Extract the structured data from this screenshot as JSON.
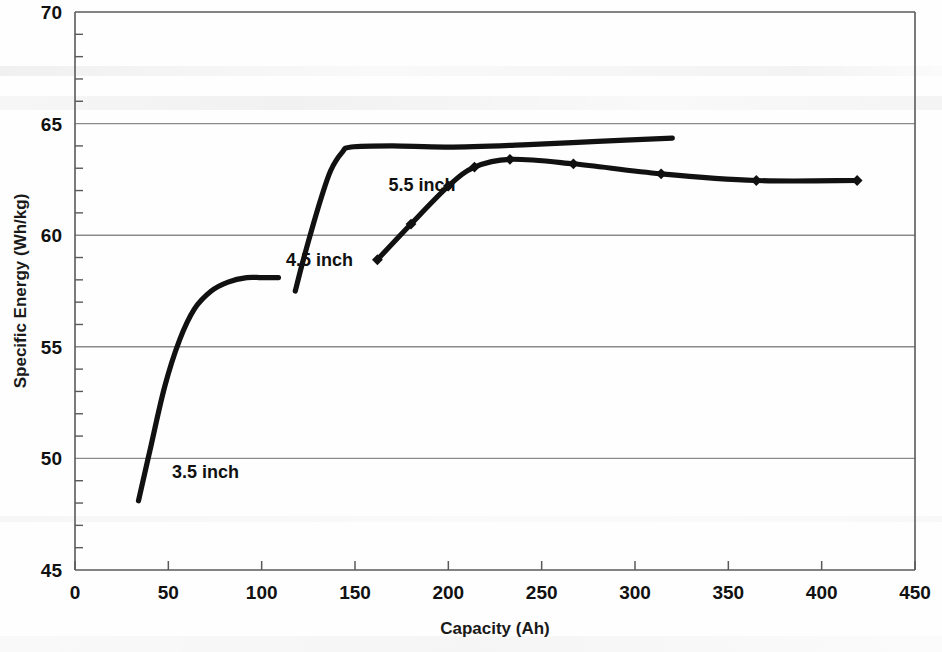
{
  "chart_data": {
    "type": "line",
    "title": "",
    "xlabel": "Capacity (Ah)",
    "ylabel": "Specific Energy (Wh/kg)",
    "xlim": [
      0,
      450
    ],
    "ylim": [
      45,
      70
    ],
    "xticks": [
      0,
      50,
      100,
      150,
      200,
      250,
      300,
      350,
      400,
      450
    ],
    "yticks": [
      45,
      50,
      55,
      60,
      65,
      70
    ],
    "y_minor_tick_interval": 1,
    "grid": "horizontal-major",
    "legend": "inline-annotations",
    "series": [
      {
        "name": "3.5 inch",
        "label": "3.5 inch",
        "marker": "none",
        "x": [
          34,
          40,
          48,
          56,
          64,
          73,
          82,
          92,
          100,
          109
        ],
        "y": [
          48.1,
          50.3,
          53.2,
          55.3,
          56.7,
          57.5,
          57.9,
          58.1,
          58.1,
          58.1
        ]
      },
      {
        "name": "4.5 inch",
        "label": "4.5 inch",
        "marker": "none",
        "x": [
          118,
          122,
          127,
          132,
          137,
          143,
          148,
          170,
          200,
          240,
          280,
          320
        ],
        "y": [
          57.5,
          58.8,
          60.3,
          61.7,
          62.9,
          63.7,
          63.95,
          64.0,
          63.95,
          64.05,
          64.2,
          64.35
        ]
      },
      {
        "name": "5.5 inch",
        "label": "5.5 inch",
        "marker": "diamond",
        "x": [
          162,
          180,
          200,
          214,
          233,
          267,
          314,
          365,
          419
        ],
        "y": [
          58.9,
          60.5,
          62.2,
          63.05,
          63.4,
          63.2,
          62.75,
          62.45,
          62.45
        ]
      }
    ],
    "annotations": [
      {
        "text": "3.5 inch",
        "x": 52,
        "y": 49.1
      },
      {
        "text": "4.5 inch",
        "x": 113,
        "y": 58.6
      },
      {
        "text": "5.5 inch",
        "x": 168,
        "y": 62.0
      }
    ]
  },
  "colors": {
    "curve": "#111111",
    "grid": "#8a8a8a",
    "axis": "#5a5a5a",
    "text": "#111111",
    "background": "#fefefe"
  }
}
